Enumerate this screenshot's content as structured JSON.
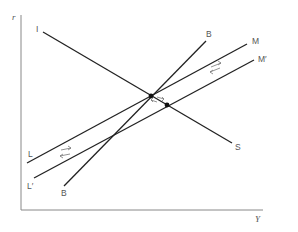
{
  "diagram": {
    "axes": {
      "y_label": "r",
      "x_label": "Y",
      "color": "#888888"
    },
    "curves": [
      {
        "id": "IS",
        "start_label": "I",
        "end_label": "S",
        "x1": 43,
        "y1": 32,
        "x2": 232,
        "y2": 143
      },
      {
        "id": "BB",
        "start_label": "B",
        "end_label": "B",
        "x1": 64,
        "y1": 186,
        "x2": 206,
        "y2": 41
      },
      {
        "id": "LM",
        "start_label": "L",
        "end_label": "M",
        "x1": 27,
        "y1": 163,
        "x2": 247,
        "y2": 44
      },
      {
        "id": "LM_prime",
        "start_label": "L′",
        "end_label": "M′",
        "x1": 34,
        "y1": 178,
        "x2": 254,
        "y2": 60
      }
    ],
    "labels": {
      "I": "I",
      "S": "S",
      "B_top": "B",
      "B_bottom": "B",
      "M": "M",
      "M_prime": "M′",
      "L": "L",
      "L_prime": "L′"
    },
    "points": [
      {
        "name": "initial-equilibrium",
        "x": 151,
        "y": 96
      },
      {
        "name": "new-equilibrium",
        "x": 167,
        "y": 105
      }
    ],
    "line_color": "#222222",
    "arrow_color": "#777777"
  }
}
